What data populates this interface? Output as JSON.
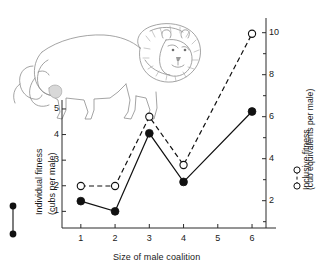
{
  "figure": {
    "illustration": "male-lion-line-drawing"
  },
  "chart_data": {
    "type": "line",
    "title": "",
    "xlabel": "Size of male coalition",
    "x": [
      1,
      2,
      3,
      4,
      6
    ],
    "xlim": [
      0.45,
      6.7
    ],
    "xticks": [
      1,
      2,
      3,
      4,
      5,
      6
    ],
    "xticklabels": [
      "1",
      "2",
      "3",
      "4",
      "5",
      "6"
    ],
    "grid": false,
    "legend_position": "outside-left-and-right-axis-labels",
    "axes": [
      {
        "side": "left",
        "label": "Individual fitness",
        "sublabel": "(cubs per male)",
        "units": "cubs per male",
        "lim": [
          0.35,
          5.35
        ],
        "ticks": [
          1,
          2,
          3,
          4,
          5
        ],
        "ticklabels": [
          "1",
          "2",
          "3",
          "4",
          "5"
        ],
        "legend_marker": "filled-circle-solid-line"
      },
      {
        "side": "right",
        "label": "Inclusive fitness",
        "sublabel": "(cub equivalents per male)",
        "units": "cub equivalents per male",
        "lim": [
          0.7,
          10.7
        ],
        "ticks": [
          2,
          4,
          6,
          8,
          10
        ],
        "ticklabels": [
          "2",
          "4",
          "6",
          "8",
          "10"
        ],
        "minor_ticks": [
          1,
          3,
          5,
          7,
          9
        ],
        "legend_marker": "open-circle-dashed-line"
      }
    ],
    "series": [
      {
        "name": "Individual fitness",
        "axis": "left",
        "marker": "filled-circle",
        "linestyle": "solid",
        "color": "#111111",
        "values": [
          1.4,
          1.0,
          4.05,
          2.15,
          4.9
        ]
      },
      {
        "name": "Inclusive fitness",
        "axis": "right",
        "marker": "open-circle",
        "linestyle": "dashed",
        "color": "#111111",
        "values": [
          2.7,
          2.7,
          6.0,
          3.7,
          9.95
        ]
      }
    ]
  }
}
